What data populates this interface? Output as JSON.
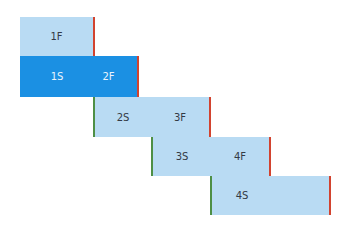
{
  "colors": {
    "light": "#b9dbf3",
    "dark": "#1b90e3",
    "end_marker": "#d2432f",
    "start_marker": "#4e8f45"
  },
  "rows": [
    {
      "labels": [
        "1F"
      ]
    },
    {
      "labels": [
        "1S",
        "2F"
      ]
    },
    {
      "labels": [
        "2S",
        "3F"
      ]
    },
    {
      "labels": [
        "3S",
        "4F"
      ]
    },
    {
      "labels": [
        "4S"
      ]
    }
  ]
}
